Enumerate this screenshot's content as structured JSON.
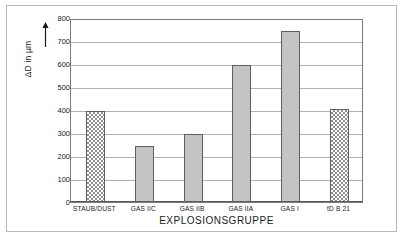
{
  "chart_data": {
    "type": "bar",
    "title": "",
    "xlabel": "EXPLOSIONSGRUPPE",
    "ylabel": "ΔD in µm",
    "ylabel_prefix": "Δ",
    "ylabel_symbol": "D",
    "ylabel_suffix": " in µm",
    "categories": [
      "STAUB/DUST",
      "GAS IIC",
      "GAS IIB",
      "GAS IIA",
      "GAS I",
      "tD B 21"
    ],
    "values": [
      397,
      245,
      296,
      595,
      745,
      405
    ],
    "ylim": [
      0,
      800
    ],
    "yticks": [
      0,
      100,
      200,
      300,
      400,
      500,
      600,
      700,
      800
    ],
    "ytick_labels": [
      "0",
      "100",
      "200",
      "300",
      "400",
      "500",
      "600",
      "700",
      "800"
    ],
    "grid": true,
    "grid_axis": "y",
    "legend": "none",
    "bar_styles": [
      "hatch",
      "solid",
      "solid",
      "solid",
      "solid",
      "hatch"
    ],
    "colors": {
      "bar_solid_fill": "#c4c4c4",
      "bar_hatch_fill": "#8f8f8f",
      "bar_edge": "#5f5f5f",
      "gridline": "#b0b0b0",
      "axis": "#7a7a7a",
      "text": "#1a1a1a",
      "frame": "#b9b9b9",
      "background": "#ffffff"
    },
    "y_axis_arrow": true
  }
}
